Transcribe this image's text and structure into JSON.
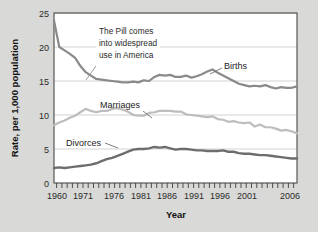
{
  "chart_data": {
    "type": "line",
    "title": "",
    "xlabel": "Year",
    "ylabel": "Rate, per 1,000 population",
    "xlim": [
      1960,
      2006
    ],
    "ylim": [
      0,
      25
    ],
    "yticks": [
      0,
      5,
      10,
      15,
      20,
      25
    ],
    "ytick_labels": [
      "0",
      "5",
      "10",
      "15",
      "20",
      "25"
    ],
    "xtick_labels": [
      "1960",
      "1971",
      "1976",
      "1981",
      "1986",
      "1991",
      "1996",
      "2001",
      "2006"
    ],
    "xtick_values": [
      1960,
      1971,
      1976,
      1981,
      1986,
      1991,
      1996,
      2001,
      2006
    ],
    "grid": "horizontal",
    "legend_position": "inline-labels",
    "x": [
      1960,
      1961,
      1962,
      1963,
      1964,
      1965,
      1966,
      1967,
      1968,
      1969,
      1970,
      1971,
      1972,
      1973,
      1974,
      1975,
      1976,
      1977,
      1978,
      1979,
      1980,
      1981,
      1982,
      1983,
      1984,
      1985,
      1986,
      1987,
      1988,
      1989,
      1990,
      1991,
      1992,
      1993,
      1994,
      1995,
      1996,
      1997,
      1998,
      1999,
      2000,
      2001,
      2002,
      2003,
      2004,
      2005,
      2006
    ],
    "series": [
      {
        "name": "Births",
        "color": "#8a8a8a",
        "values": [
          23.9,
          20.0,
          19.5,
          19.0,
          18.4,
          17.2,
          16.3,
          15.8,
          15.3,
          15.2,
          15.1,
          15.0,
          14.9,
          14.8,
          14.8,
          14.9,
          14.8,
          15.1,
          15.0,
          15.6,
          15.9,
          15.8,
          15.9,
          15.6,
          15.6,
          15.8,
          15.5,
          15.7,
          16.0,
          16.4,
          16.7,
          16.2,
          15.8,
          15.4,
          15.0,
          14.6,
          14.4,
          14.2,
          14.3,
          14.2,
          14.4,
          14.1,
          13.9,
          14.1,
          14.0,
          14.0,
          14.2
        ]
      },
      {
        "name": "Marriages",
        "color": "#bdbdbd",
        "values": [
          8.5,
          8.9,
          9.2,
          9.6,
          9.9,
          10.4,
          10.9,
          10.6,
          10.4,
          10.6,
          10.6,
          10.9,
          11.0,
          10.8,
          10.5,
          10.0,
          9.9,
          9.9,
          10.3,
          10.4,
          10.6,
          10.6,
          10.6,
          10.5,
          10.5,
          10.1,
          10.0,
          9.9,
          9.8,
          9.7,
          9.8,
          9.4,
          9.3,
          9.0,
          9.1,
          8.9,
          8.8,
          8.9,
          8.3,
          8.6,
          8.2,
          8.2,
          8.0,
          7.7,
          7.8,
          7.6,
          7.3
        ]
      },
      {
        "name": "Divorces",
        "color": "#6d6d6d",
        "values": [
          2.2,
          2.3,
          2.2,
          2.3,
          2.4,
          2.5,
          2.6,
          2.7,
          2.9,
          3.2,
          3.5,
          3.7,
          4.0,
          4.3,
          4.6,
          4.9,
          5.0,
          5.0,
          5.1,
          5.3,
          5.2,
          5.3,
          5.1,
          4.9,
          5.0,
          5.0,
          4.9,
          4.8,
          4.8,
          4.7,
          4.7,
          4.7,
          4.8,
          4.6,
          4.6,
          4.4,
          4.3,
          4.3,
          4.2,
          4.1,
          4.1,
          4.0,
          3.9,
          3.8,
          3.7,
          3.6,
          3.6
        ]
      }
    ],
    "annotations": [
      {
        "id": "pill-annotation",
        "text_lines": [
          "The Pill comes",
          "into widespread",
          "use in America"
        ],
        "text": "The Pill comes into widespread use in America"
      }
    ],
    "series_label_divorces": "Divorces",
    "series_label_marriages": "Marriages",
    "series_label_births": "Births"
  },
  "colors": {
    "background": "#d9d9d7",
    "plot_background": "#ffffff",
    "frame": "#4a4a4a",
    "gridline": "#c8c8c8",
    "text": "#222222"
  }
}
